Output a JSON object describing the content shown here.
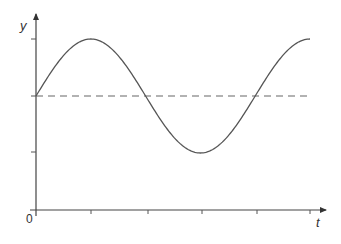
{
  "chart_data": {
    "type": "line",
    "title": "",
    "xlabel": "t",
    "ylabel": "y",
    "origin_label": "0",
    "x_ticks": [
      1,
      2,
      3,
      4,
      5
    ],
    "y_ticks": [
      -1,
      0,
      1
    ],
    "tick_labels_shown": false,
    "grid": false,
    "legend": null,
    "series": [
      {
        "name": "y(t)",
        "style": "solid",
        "description": "sinusoid starting at equilibrium going up; peak at t=1, equilibrium at t=2, trough at t=3, equilibrium at t=4, peak at t=5",
        "x": [
          0,
          1,
          2,
          3,
          4,
          5
        ],
        "y": [
          0,
          1,
          0,
          -1,
          0,
          1
        ]
      },
      {
        "name": "equilibrium",
        "style": "dashed",
        "x": [
          0,
          5
        ],
        "y": [
          0,
          0
        ]
      }
    ],
    "xlim": [
      0,
      5.3
    ],
    "ylim": [
      -2,
      1.5
    ],
    "colors": {
      "curve": "#555555",
      "axes": "#444444",
      "dashed": "#666666"
    }
  }
}
